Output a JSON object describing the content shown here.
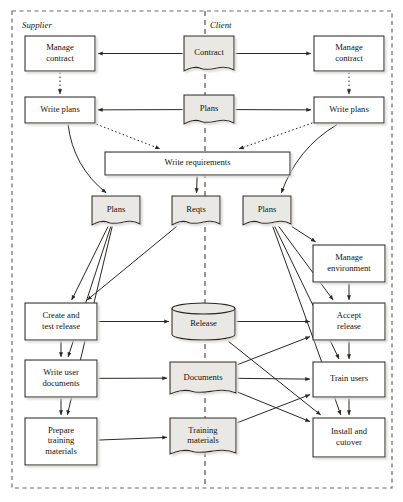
{
  "diagram": {
    "colors": {
      "line": "#2b2724",
      "process_fill": "#ffffff",
      "artefact_fill": "#e9e8e4",
      "boundary": "#6d6a66",
      "text": "#15130f",
      "shadow": "#b9b6b1"
    },
    "boundary": {
      "name": "outer-boundary",
      "style": "dashed"
    },
    "divider": {
      "name": "swimlane-divider",
      "style": "dashed",
      "x": 205
    },
    "swimlanes": [
      {
        "id": "supplier",
        "label": "Supplier",
        "x": 22,
        "y": 28
      },
      {
        "id": "client",
        "label": "Client",
        "x": 210,
        "y": 28
      }
    ],
    "nodes": [
      {
        "id": "manage-contract-supplier",
        "label": "Manage contract",
        "lines": [
          "Manage",
          "contract"
        ],
        "shape": "process",
        "x": 25,
        "y": 36,
        "w": 70,
        "h": 35
      },
      {
        "id": "contract",
        "label": "Contract",
        "lines": [
          "Contract"
        ],
        "shape": "document",
        "x": 184,
        "y": 36,
        "w": 50,
        "h": 35
      },
      {
        "id": "manage-contract-client",
        "label": "Manage contract",
        "lines": [
          "Manage",
          "contract"
        ],
        "shape": "process",
        "x": 314,
        "y": 36,
        "w": 70,
        "h": 35
      },
      {
        "id": "write-plans-supplier",
        "label": "Write plans",
        "lines": [
          "Write plans"
        ],
        "shape": "process",
        "x": 25,
        "y": 97,
        "w": 70,
        "h": 26
      },
      {
        "id": "plans-central",
        "label": "Plans",
        "lines": [
          "Plans"
        ],
        "shape": "document",
        "x": 184,
        "y": 95,
        "w": 50,
        "h": 29
      },
      {
        "id": "write-plans-client",
        "label": "Write plans",
        "lines": [
          "Write plans"
        ],
        "shape": "process",
        "x": 314,
        "y": 97,
        "w": 70,
        "h": 26
      },
      {
        "id": "write-requirements",
        "label": "Write requirements",
        "lines": [
          "Write requirements"
        ],
        "shape": "process",
        "x": 105,
        "y": 152,
        "w": 185,
        "h": 23
      },
      {
        "id": "plans-supplier",
        "label": "Plans",
        "lines": [
          "Plans"
        ],
        "shape": "document",
        "x": 92,
        "y": 196,
        "w": 48,
        "h": 29
      },
      {
        "id": "reqts",
        "label": "Reqts",
        "lines": [
          "Reqts"
        ],
        "shape": "document",
        "x": 172,
        "y": 196,
        "w": 48,
        "h": 29
      },
      {
        "id": "plans-client",
        "label": "Plans",
        "lines": [
          "Plans"
        ],
        "shape": "document",
        "x": 243,
        "y": 196,
        "w": 48,
        "h": 29
      },
      {
        "id": "manage-environment",
        "label": "Manage environment",
        "lines": [
          "Manage",
          "environment"
        ],
        "shape": "process",
        "x": 313,
        "y": 245,
        "w": 72,
        "h": 37
      },
      {
        "id": "create-and-test-release",
        "label": "Create and test release",
        "lines": [
          "Create and",
          "test release"
        ],
        "shape": "process",
        "x": 25,
        "y": 303,
        "w": 72,
        "h": 37
      },
      {
        "id": "release",
        "label": "Release",
        "lines": [
          "Release"
        ],
        "shape": "cylinder",
        "x": 172,
        "y": 303,
        "w": 63,
        "h": 37
      },
      {
        "id": "accept-release",
        "label": "Accept release",
        "lines": [
          "Accept",
          "release"
        ],
        "shape": "process",
        "x": 313,
        "y": 303,
        "w": 72,
        "h": 37
      },
      {
        "id": "write-user-documents",
        "label": "Write user documents",
        "lines": [
          "Write user",
          "documents"
        ],
        "shape": "process",
        "x": 25,
        "y": 360,
        "w": 72,
        "h": 37
      },
      {
        "id": "documents",
        "label": "Documents",
        "lines": [
          "Documents"
        ],
        "shape": "document",
        "x": 170,
        "y": 362,
        "w": 66,
        "h": 32
      },
      {
        "id": "train-users",
        "label": "Train users",
        "lines": [
          "Train users"
        ],
        "shape": "process",
        "x": 313,
        "y": 362,
        "w": 72,
        "h": 35
      },
      {
        "id": "prepare-training-materials",
        "label": "Prepare training materials",
        "lines": [
          "Prepare",
          "training",
          "materials"
        ],
        "shape": "process",
        "x": 25,
        "y": 418,
        "w": 72,
        "h": 47
      },
      {
        "id": "training-materials",
        "label": "Training materials",
        "lines": [
          "Training",
          "materials"
        ],
        "shape": "document",
        "x": 170,
        "y": 418,
        "w": 66,
        "h": 36
      },
      {
        "id": "install-and-cutover",
        "label": "Install and cutover",
        "lines": [
          "Install and",
          "cutover"
        ],
        "shape": "process",
        "x": 313,
        "y": 418,
        "w": 72,
        "h": 39
      }
    ],
    "edges": [
      {
        "from": "contract",
        "to": "manage-contract-supplier",
        "style": "solid"
      },
      {
        "from": "contract",
        "to": "manage-contract-client",
        "style": "solid"
      },
      {
        "from": "manage-contract-supplier",
        "to": "write-plans-supplier",
        "style": "dotted"
      },
      {
        "from": "manage-contract-client",
        "to": "write-plans-client",
        "style": "dotted"
      },
      {
        "from": "plans-central",
        "to": "write-plans-supplier",
        "style": "solid"
      },
      {
        "from": "plans-central",
        "to": "write-plans-client",
        "style": "solid"
      },
      {
        "from": "write-plans-supplier",
        "to": "write-requirements",
        "style": "dotted"
      },
      {
        "from": "write-plans-client",
        "to": "write-requirements",
        "style": "dotted"
      },
      {
        "from": "write-plans-supplier",
        "to": "plans-supplier",
        "style": "curve"
      },
      {
        "from": "write-plans-client",
        "to": "plans-client",
        "style": "curve"
      },
      {
        "from": "write-requirements",
        "to": "reqts",
        "style": "solid"
      },
      {
        "from": "plans-supplier",
        "to": "create-and-test-release",
        "style": "solid"
      },
      {
        "from": "plans-supplier",
        "to": "write-user-documents",
        "style": "solid"
      },
      {
        "from": "plans-supplier",
        "to": "prepare-training-materials",
        "style": "solid"
      },
      {
        "from": "reqts",
        "to": "create-and-test-release",
        "style": "solid"
      },
      {
        "from": "plans-client",
        "to": "manage-environment",
        "style": "solid"
      },
      {
        "from": "plans-client",
        "to": "accept-release",
        "style": "solid"
      },
      {
        "from": "plans-client",
        "to": "train-users",
        "style": "solid"
      },
      {
        "from": "plans-client",
        "to": "install-and-cutover",
        "style": "solid"
      },
      {
        "from": "manage-environment",
        "to": "accept-release",
        "style": "solid"
      },
      {
        "from": "create-and-test-release",
        "to": "release",
        "style": "solid"
      },
      {
        "from": "create-and-test-release",
        "to": "write-user-documents",
        "style": "solid"
      },
      {
        "from": "write-user-documents",
        "to": "prepare-training-materials",
        "style": "solid"
      },
      {
        "from": "write-user-documents",
        "to": "documents",
        "style": "solid"
      },
      {
        "from": "prepare-training-materials",
        "to": "training-materials",
        "style": "solid"
      },
      {
        "from": "release",
        "to": "accept-release",
        "style": "solid"
      },
      {
        "from": "release",
        "to": "install-and-cutover",
        "style": "solid"
      },
      {
        "from": "documents",
        "to": "train-users",
        "style": "solid"
      },
      {
        "from": "documents",
        "to": "accept-release",
        "style": "solid"
      },
      {
        "from": "documents",
        "to": "install-and-cutover",
        "style": "solid"
      },
      {
        "from": "training-materials",
        "to": "train-users",
        "style": "solid"
      },
      {
        "from": "accept-release",
        "to": "train-users",
        "style": "solid"
      },
      {
        "from": "train-users",
        "to": "install-and-cutover",
        "style": "solid"
      }
    ]
  }
}
